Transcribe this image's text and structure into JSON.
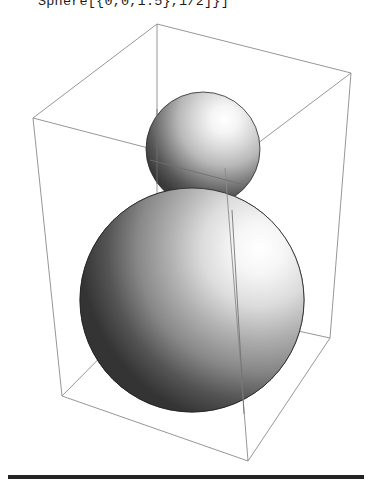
{
  "window": {
    "title": "Graphics3D Sphere Output",
    "background_color": "#ffffff"
  },
  "code": {
    "expression": "Sphere[{0,0,1.5},1/2]}]",
    "text_color": "#1b1b1b"
  },
  "graphic": {
    "label": "Graphics3D rendering of two shaded spheres inside a wireframe bounding box",
    "wireframe_color": "#8a8a8a",
    "wireframe_width": 0.9,
    "box": {
      "label": "bounding-box",
      "vertices": {
        "top_back_left": [
          33,
          118
        ],
        "top_back_apex": [
          157,
          24
        ],
        "top_back_right": [
          351,
          73
        ],
        "top_front": [
          225,
          168
        ],
        "bottom_back_left": [
          62,
          396
        ],
        "bottom_front_apex": [
          157,
          300
        ],
        "bottom_back_right": [
          330,
          338
        ],
        "bottom_front": [
          248,
          461
        ]
      }
    },
    "spheres": [
      {
        "name": "small-sphere",
        "center": [
          203,
          149
        ],
        "radius": 57,
        "highlight": [
          0.69,
          0.24
        ],
        "highlight_color": "#ffffff",
        "midtone_color": "#b8b8b8",
        "shadow_color": "#3a3a3a",
        "edge_color": "#2a2a2a"
      },
      {
        "name": "large-sphere",
        "center": [
          192,
          300
        ],
        "radius": 112,
        "highlight": [
          0.8,
          0.27
        ],
        "highlight_color": "#ffffff",
        "midtone_color": "#b0b0b0",
        "shadow_color": "#343434",
        "edge_color": "#232323"
      }
    ]
  },
  "separator": {
    "label": "horizontal-rule",
    "color": "#232323",
    "x_start": 8,
    "x_end": 364,
    "y": 475,
    "thickness": 4
  }
}
